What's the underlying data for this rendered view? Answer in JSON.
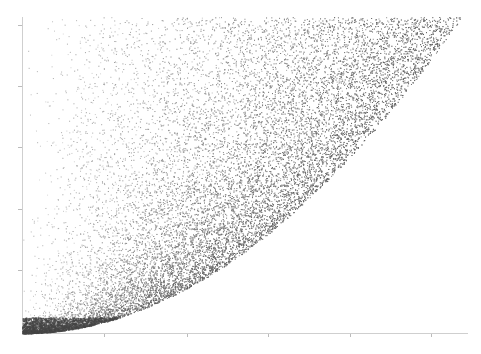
{
  "chart_data": {
    "type": "scatter",
    "title": "",
    "xlabel": "",
    "ylabel": "",
    "x_ticks_px": [
      104,
      187,
      268,
      350,
      431
    ],
    "y_ticks_px": [
      25,
      86,
      147,
      209,
      270
    ],
    "tick_labels_legible": false,
    "xlim": [
      0,
      1
    ],
    "ylim": [
      0,
      1
    ],
    "boundary_curve": {
      "shape": "y = x^2 style (x = sqrt(y))",
      "from": [
        0,
        0
      ],
      "to": [
        1,
        1
      ]
    },
    "point_color": "#555555",
    "grid": false,
    "legend": null
  },
  "plot": {
    "left": 22,
    "right": 462,
    "top": 17,
    "bottom": 333,
    "axis_color": "#cfcfcf",
    "point_count": 22000
  }
}
